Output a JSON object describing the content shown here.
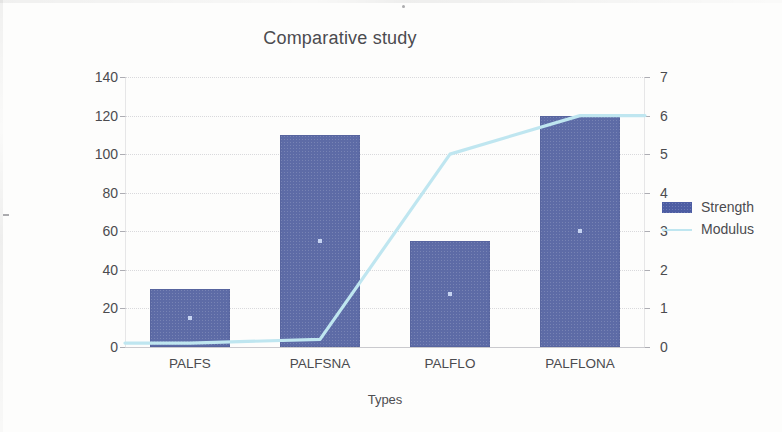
{
  "chart_data": {
    "type": "bar",
    "title": "Comparative study",
    "xlabel": "Types",
    "ylabel": "Flexural strenght (MPa) and Flexural Modulus (GPa)",
    "categories": [
      "PALFS",
      "PALFSNA",
      "PALFLO",
      "PALFLONA"
    ],
    "series": [
      {
        "name": "Strength",
        "type": "bar",
        "axis": "left",
        "unit": "MPa",
        "color": "#5d6ba6",
        "values": [
          30,
          110,
          55,
          120
        ]
      },
      {
        "name": "Modulus",
        "type": "line",
        "axis": "right",
        "unit": "GPa",
        "color": "#bfe6f0",
        "values": [
          0.1,
          0.2,
          5.0,
          6.0
        ]
      }
    ],
    "left_axis": {
      "label": "Flexural strenght (MPa) and Flexural Modulus (GPa)",
      "ticks": [
        "0",
        "20",
        "40",
        "60",
        "80",
        "100",
        "120",
        "140"
      ],
      "ylim": [
        0,
        140
      ],
      "step": 20
    },
    "right_axis": {
      "ticks": [
        "0",
        "1",
        "2",
        "3",
        "4",
        "5",
        "6",
        "7"
      ],
      "ylim": [
        0,
        7
      ],
      "step": 1
    },
    "grid": true,
    "legend_position": "right"
  },
  "legend": {
    "entries": [
      {
        "label": "Strength",
        "swatch": "bar-swatch-icon"
      },
      {
        "label": "Modulus",
        "swatch": "line-swatch-icon"
      }
    ]
  }
}
